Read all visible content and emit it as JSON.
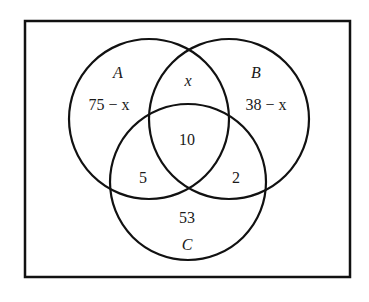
{
  "diagram": {
    "type": "venn",
    "universe": {
      "x": 25,
      "y": 21,
      "width": 325,
      "height": 256
    },
    "stroke_color": "#111111",
    "sets": [
      {
        "name": "A",
        "cx": 149,
        "cy": 119,
        "r": 80
      },
      {
        "name": "B",
        "cx": 229,
        "cy": 119,
        "r": 80
      },
      {
        "name": "C",
        "cx": 188,
        "cy": 182,
        "r": 78
      }
    ],
    "labels": {
      "set_a": "A",
      "set_b": "B",
      "set_c": "C",
      "a_only": "75 − x",
      "b_only": "38 − x",
      "ab_only": "x",
      "abc": "10",
      "ac_only": "5",
      "bc_only": "2",
      "c_only": "53"
    }
  }
}
